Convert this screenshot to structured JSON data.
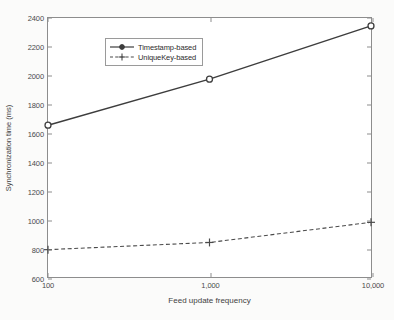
{
  "chart_data": {
    "type": "line",
    "title": "",
    "xlabel": "Feed update frequency",
    "ylabel": "Synchronization time (ms)",
    "categories": [
      "100",
      "1,000",
      "10,000"
    ],
    "x_tick_labels": [
      "100",
      "1,000",
      "10,000"
    ],
    "y_tick_labels": [
      "600",
      "800",
      "1000",
      "1200",
      "1400",
      "1600",
      "1800",
      "2000",
      "2200",
      "2400"
    ],
    "y_ticks": [
      600,
      800,
      1000,
      1200,
      1400,
      1600,
      1800,
      2000,
      2200,
      2400
    ],
    "ylim": [
      600,
      2400
    ],
    "xlim": [
      0,
      2
    ],
    "grid": false,
    "legend_position": "top-left",
    "series": [
      {
        "name": "Timestamp-based",
        "values": [
          1655,
          1975,
          2345
        ],
        "line_style": "solid",
        "marker": "circle",
        "color": "#3d3d3d"
      },
      {
        "name": "UniqueKey-based",
        "values": [
          790,
          840,
          980
        ],
        "line_style": "dashed",
        "marker": "plus",
        "color": "#4a4a4a"
      }
    ]
  },
  "legend": {
    "entries": [
      {
        "label": "Timestamp-based"
      },
      {
        "label": "UniqueKey-based"
      }
    ]
  },
  "axes": {
    "x_title": "Feed update frequency",
    "y_title": "Synchronization time (ms)"
  }
}
